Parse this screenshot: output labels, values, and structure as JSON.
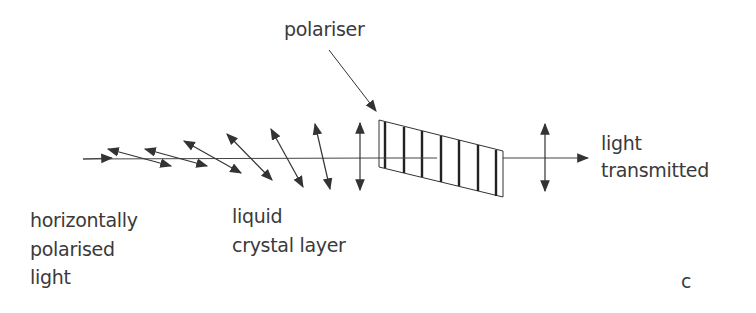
{
  "diagram": {
    "labels": {
      "polariser": "polariser",
      "light_transmitted_line1": "light",
      "light_transmitted_line2": "transmitted",
      "input_line1": "horizontally",
      "input_line2": "polarised",
      "input_line3": "light",
      "lc_line1": "liquid",
      "lc_line2": "crystal layer",
      "panel_letter": "c"
    },
    "colors": {
      "stroke": "#333333",
      "text": "#3a3a3a",
      "background": "#ffffff"
    },
    "nodes": [
      {
        "id": "input-light",
        "label": "horizontally polarised light"
      },
      {
        "id": "liquid-crystal-layer",
        "label": "liquid crystal layer",
        "rotation_steps": 8
      },
      {
        "id": "polariser",
        "label": "polariser",
        "slits": 7
      },
      {
        "id": "transmitted-light",
        "label": "light transmitted"
      }
    ],
    "edges": [
      {
        "from": "input-light",
        "to": "liquid-crystal-layer"
      },
      {
        "from": "liquid-crystal-layer",
        "to": "polariser"
      },
      {
        "from": "polariser",
        "to": "transmitted-light"
      }
    ]
  }
}
